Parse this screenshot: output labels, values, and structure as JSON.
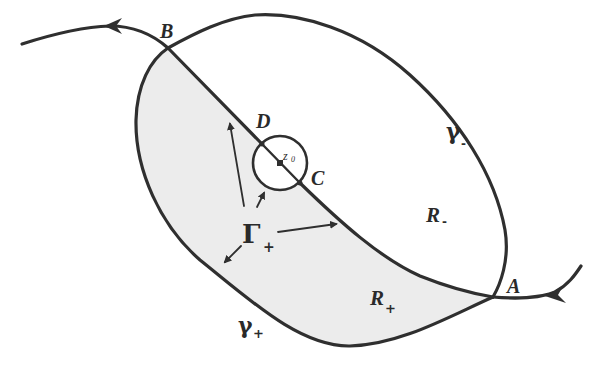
{
  "diagram": {
    "type": "contour-deformation-figure",
    "colors": {
      "stroke": "#2f2f2f",
      "shaded_region": "#ececec",
      "background": "#ffffff"
    },
    "points": {
      "A": "A",
      "B": "B",
      "C": "C",
      "D": "D",
      "z0": "z",
      "z0_sub": "0"
    },
    "curves": {
      "gamma_minus": {
        "symbol": "γ",
        "sub": "-"
      },
      "gamma_plus": {
        "symbol": "γ",
        "sub": "+"
      },
      "Gamma_plus": {
        "symbol": "Γ",
        "sub": "+"
      }
    },
    "regions": {
      "R_minus": {
        "symbol": "R",
        "sub": "-"
      },
      "R_plus": {
        "symbol": "R",
        "sub": "+"
      }
    }
  }
}
